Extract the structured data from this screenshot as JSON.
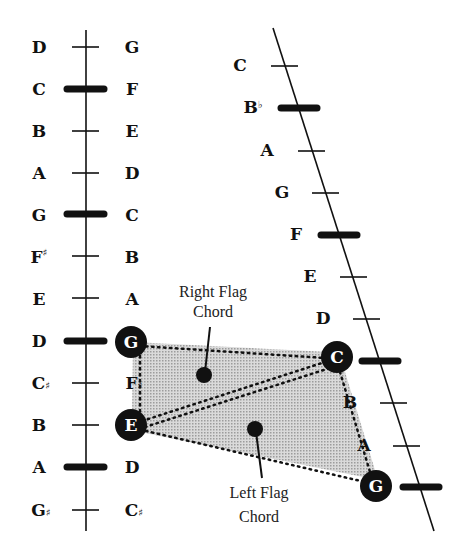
{
  "colors": {
    "ink": "#111111",
    "shade": "#bdbdbd",
    "background": "#ffffff"
  },
  "left_string": {
    "inner_labels": [
      {
        "note": "D",
        "acc": ""
      },
      {
        "note": "C",
        "acc": ""
      },
      {
        "note": "B",
        "acc": ""
      },
      {
        "note": "A",
        "acc": ""
      },
      {
        "note": "G",
        "acc": ""
      },
      {
        "note": "F",
        "acc": "♯"
      },
      {
        "note": "E",
        "acc": ""
      },
      {
        "note": "D",
        "acc": ""
      },
      {
        "note": "C",
        "acc": "♯"
      },
      {
        "note": "B",
        "acc": ""
      },
      {
        "note": "A",
        "acc": ""
      },
      {
        "note": "G",
        "acc": "♯"
      }
    ],
    "outer_labels": [
      {
        "note": "G",
        "acc": ""
      },
      {
        "note": "F",
        "acc": ""
      },
      {
        "note": "E",
        "acc": ""
      },
      {
        "note": "D",
        "acc": ""
      },
      {
        "note": "C",
        "acc": ""
      },
      {
        "note": "B",
        "acc": ""
      },
      {
        "note": "A",
        "acc": ""
      },
      {
        "note": "G",
        "acc": ""
      },
      {
        "note": "F",
        "acc": "♯"
      },
      {
        "note": "E",
        "acc": ""
      },
      {
        "note": "D",
        "acc": ""
      },
      {
        "note": "C",
        "acc": "♯"
      }
    ],
    "flag_positions": [
      "C",
      "G",
      "D",
      "A"
    ]
  },
  "right_string": {
    "labels": [
      {
        "note": "C",
        "acc": ""
      },
      {
        "note": "B",
        "acc": "♭"
      },
      {
        "note": "A",
        "acc": ""
      },
      {
        "note": "G",
        "acc": ""
      },
      {
        "note": "F",
        "acc": ""
      },
      {
        "note": "E",
        "acc": ""
      },
      {
        "note": "D",
        "acc": ""
      },
      {
        "note": "C",
        "acc": ""
      },
      {
        "note": "B",
        "acc": ""
      },
      {
        "note": "A",
        "acc": ""
      },
      {
        "note": "G",
        "acc": ""
      }
    ],
    "flag_positions": [
      "B♭",
      "F",
      "C",
      "G"
    ]
  },
  "chord_nodes": {
    "left_g": "G",
    "left_e": "E",
    "right_c": "C",
    "right_g": "G"
  },
  "annotations": {
    "right_flag_line1": "Right Flag",
    "right_flag_line2": "Chord",
    "left_flag_line1": "Left Flag",
    "left_flag_line2": "Chord"
  }
}
